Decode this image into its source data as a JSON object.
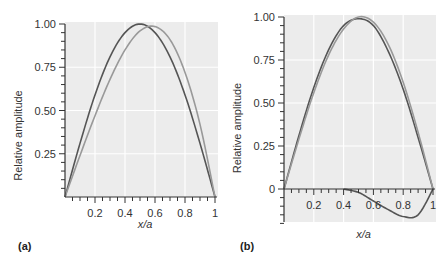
{
  "chart_data": [
    {
      "type": "line",
      "panel_label": "(a)",
      "xlabel": "x/a",
      "ylabel": "Relative amplitude",
      "xlim": [
        0,
        1
      ],
      "ylim": [
        0,
        1.0
      ],
      "x_ticks": [
        "0.2",
        "0.4",
        "0.6",
        "0.8",
        "1"
      ],
      "y_ticks": [
        "0.25",
        "0.50",
        "0.75",
        "1.00"
      ],
      "grid": true,
      "x": [
        0,
        0.1,
        0.2,
        0.3,
        0.4,
        0.5,
        0.6,
        0.7,
        0.8,
        0.9,
        1.0
      ],
      "series": [
        {
          "name": "dark curve",
          "color": "#555555",
          "values": [
            0,
            0.31,
            0.59,
            0.81,
            0.95,
            1.0,
            0.95,
            0.81,
            0.59,
            0.31,
            0
          ]
        },
        {
          "name": "light curve",
          "color": "#999999",
          "values": [
            0,
            0.24,
            0.47,
            0.68,
            0.85,
            0.96,
            0.985,
            0.91,
            0.72,
            0.42,
            0
          ]
        }
      ]
    },
    {
      "type": "line",
      "panel_label": "(b)",
      "xlabel": "x/a",
      "ylabel": "Relative amplitude",
      "xlim": [
        0,
        1
      ],
      "ylim": [
        -0.2,
        1.0
      ],
      "x_ticks": [
        "0.2",
        "0.4",
        "0.6",
        "0.8",
        "1"
      ],
      "y_ticks": [
        "0",
        "0.25",
        "0.50",
        "0.75",
        "1.00"
      ],
      "grid": true,
      "x": [
        0,
        0.1,
        0.2,
        0.3,
        0.4,
        0.5,
        0.6,
        0.7,
        0.8,
        0.9,
        1.0
      ],
      "series": [
        {
          "name": "dark curve",
          "color": "#555555",
          "values": [
            0,
            0.31,
            0.59,
            0.81,
            0.95,
            0.99,
            0.95,
            0.8,
            0.58,
            0.3,
            0
          ]
        },
        {
          "name": "light curve",
          "color": "#999999",
          "values": [
            0,
            0.29,
            0.56,
            0.78,
            0.93,
            1.0,
            0.97,
            0.84,
            0.62,
            0.33,
            0
          ]
        },
        {
          "name": "difference curve",
          "color": "#555555",
          "values": [
            null,
            null,
            null,
            null,
            0,
            -0.02,
            -0.07,
            -0.12,
            -0.16,
            -0.15,
            0
          ]
        }
      ]
    }
  ]
}
